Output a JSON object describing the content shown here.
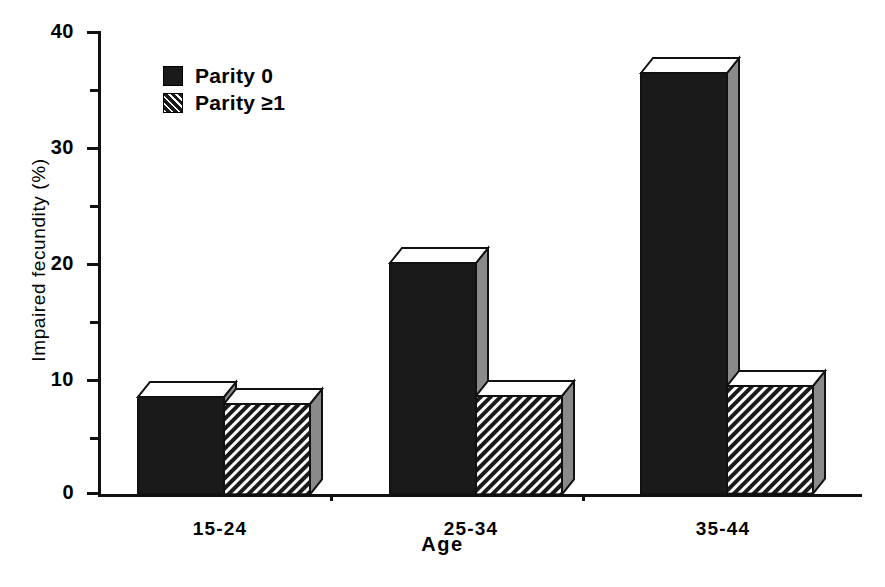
{
  "chart_data": {
    "type": "bar",
    "title": "",
    "subtitle": "",
    "xlabel": "Age",
    "ylabel": "Impaired fecundity (%)",
    "categories": [
      "15-24",
      "25-34",
      "35-44"
    ],
    "series": [
      {
        "name": "Parity 0",
        "values": [
          8.4,
          20.0,
          36.4
        ],
        "fill": "solid-black",
        "color": "#1a1a1a"
      },
      {
        "name": "Parity ≥1",
        "values": [
          7.8,
          8.5,
          9.3
        ],
        "fill": "diagonal-hatch",
        "color": "#1a1a1a"
      }
    ],
    "ylim": [
      0,
      40
    ],
    "ytick_major": [
      0,
      10,
      20,
      30,
      40
    ],
    "ytick_minor": [
      5,
      15,
      25,
      35
    ],
    "ytick_labels": [
      "0",
      "10",
      "20",
      "30",
      "40"
    ],
    "grid": false,
    "legend_position": "top-left-inside",
    "style": "3d-blocks",
    "annotations": []
  },
  "axes": {
    "y_title": "Impaired fecundity (%)",
    "x_title": "Age",
    "y_labels": [
      "40",
      "30",
      "20",
      "10",
      "0"
    ],
    "x_labels": [
      "15-24",
      "25-34",
      "35-44"
    ]
  },
  "legend": {
    "items": [
      {
        "label": "Parity 0",
        "swatch": "solid-black-swatch"
      },
      {
        "label": "Parity ≥1",
        "swatch": "hatched-swatch"
      }
    ]
  },
  "colors": {
    "ink": "#111111",
    "bar_front": "#1a1a1a",
    "bar_side": "#8a8a8a",
    "bar_top": "#ffffff",
    "background": "#ffffff"
  }
}
